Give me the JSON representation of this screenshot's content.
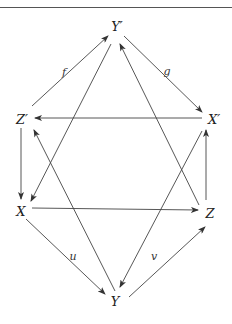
{
  "diagram": {
    "title": "",
    "stroke_color": "#444444",
    "nodes": [
      {
        "id": "Yp",
        "label": "Y′",
        "x": 117,
        "y": 26
      },
      {
        "id": "Zp",
        "label": "Z′",
        "x": 22,
        "y": 119
      },
      {
        "id": "Xp",
        "label": "X′",
        "x": 214,
        "y": 119
      },
      {
        "id": "X",
        "label": "X",
        "x": 21,
        "y": 211
      },
      {
        "id": "Z",
        "label": "Z",
        "x": 210,
        "y": 213
      },
      {
        "id": "Y",
        "label": "Y",
        "x": 115,
        "y": 301
      }
    ],
    "edges": [
      {
        "from": "Zp",
        "to": "Yp",
        "label": "f",
        "x1": 32,
        "y1": 106,
        "x2": 108,
        "y2": 36,
        "lx": 64,
        "ly": 72
      },
      {
        "from": "Yp",
        "to": "Xp",
        "label": "g",
        "x1": 124,
        "y1": 36,
        "x2": 202,
        "y2": 112,
        "lx": 167,
        "ly": 71
      },
      {
        "from": "Xp",
        "to": "Zp",
        "label": "",
        "x1": 202,
        "y1": 118,
        "x2": 35,
        "y2": 118
      },
      {
        "from": "Zp",
        "to": "X",
        "label": "",
        "x1": 21,
        "y1": 128,
        "x2": 21,
        "y2": 199
      },
      {
        "from": "Z",
        "to": "Xp",
        "label": "",
        "x1": 206,
        "y1": 200,
        "x2": 206,
        "y2": 130
      },
      {
        "from": "X",
        "to": "Z",
        "label": "",
        "x1": 32,
        "y1": 208,
        "x2": 198,
        "y2": 210
      },
      {
        "from": "X",
        "to": "Y",
        "label": "u",
        "x1": 26,
        "y1": 219,
        "x2": 105,
        "y2": 294,
        "lx": 73,
        "ly": 256
      },
      {
        "from": "Y",
        "to": "Z",
        "label": "v",
        "x1": 129,
        "y1": 297,
        "x2": 205,
        "y2": 227,
        "lx": 154,
        "ly": 256
      },
      {
        "from": "Yp",
        "to": "X",
        "label": "",
        "x1": 111,
        "y1": 44,
        "x2": 31,
        "y2": 201
      },
      {
        "from": "Z",
        "to": "Yp",
        "label": "",
        "x1": 199,
        "y1": 205,
        "x2": 120,
        "y2": 44
      },
      {
        "from": "Y",
        "to": "Zp",
        "label": "",
        "x1": 115,
        "y1": 291,
        "x2": 34,
        "y2": 130
      },
      {
        "from": "Xp",
        "to": "Y",
        "label": "",
        "x1": 202,
        "y1": 131,
        "x2": 120,
        "y2": 287
      }
    ]
  },
  "labels": {
    "Yp": "Y′",
    "Zp": "Z′",
    "Xp": "X′",
    "X": "X",
    "Z": "Z",
    "Y": "Y",
    "f": "f",
    "g": "g",
    "u": "u",
    "v": "v"
  }
}
